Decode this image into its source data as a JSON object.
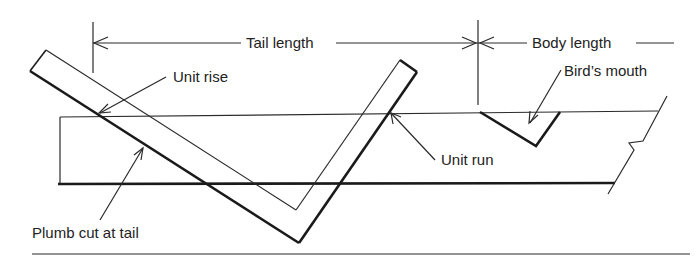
{
  "diagram": {
    "labels": {
      "tail_length": "Tail length",
      "body_length": "Body length",
      "unit_rise": "Unit rise",
      "birds_mouth": "Bird’s mouth",
      "unit_run": "Unit run",
      "plumb_cut": "Plumb cut at tail"
    },
    "colors": {
      "line": "#1a1a1a",
      "background": "#ffffff"
    }
  }
}
